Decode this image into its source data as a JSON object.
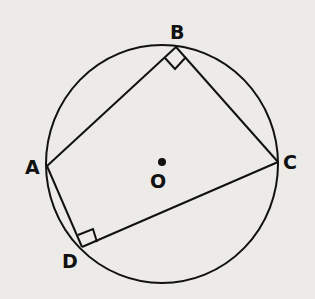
{
  "figure": {
    "type": "inscribed quadrilateral in circle",
    "center_label": "O",
    "vertices": [
      {
        "label": "A",
        "x": 47,
        "y": 166
      },
      {
        "label": "B",
        "x": 176,
        "y": 47
      },
      {
        "label": "C",
        "x": 278,
        "y": 162
      },
      {
        "label": "D",
        "x": 82,
        "y": 247
      }
    ],
    "right_angles": [
      "B",
      "D"
    ],
    "circle": {
      "cx": 162,
      "cy": 164,
      "rx": 116,
      "ry": 119
    },
    "colors": {
      "background": "#ecebe8",
      "ink": "#111111"
    }
  },
  "labels": {
    "A": "A",
    "B": "B",
    "C": "C",
    "D": "D",
    "O": "O"
  }
}
